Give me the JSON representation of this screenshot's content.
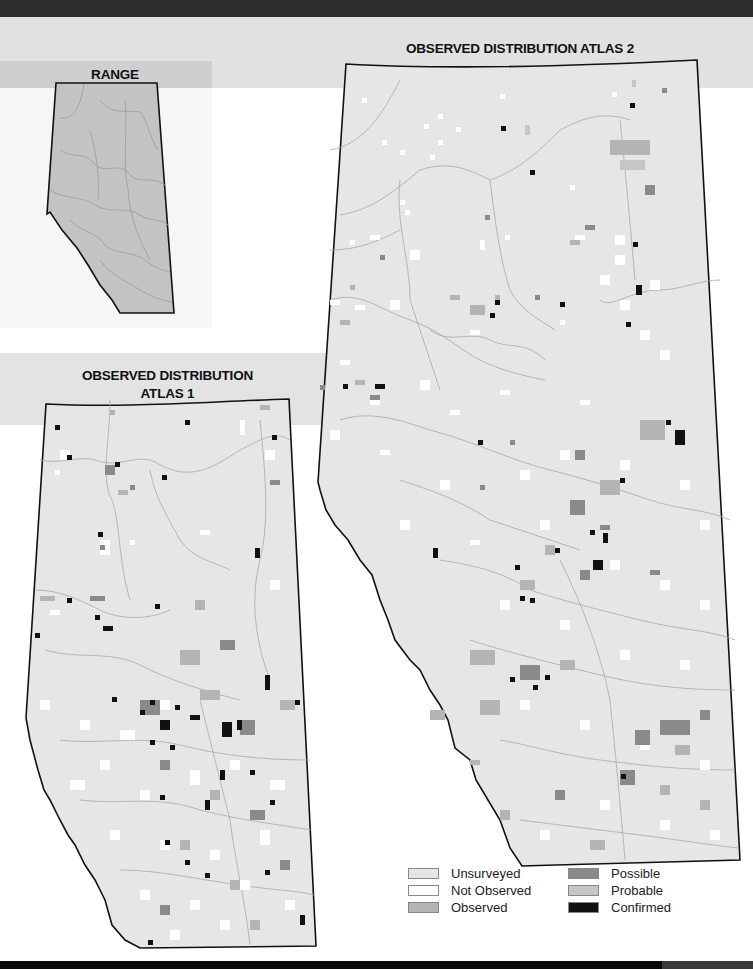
{
  "titles": {
    "range": "RANGE",
    "atlas2": "OBSERVED DISTRIBUTION ATLAS 2",
    "atlas1_line1": "OBSERVED DISTRIBUTION",
    "atlas1_line2": "ATLAS 1"
  },
  "legend": {
    "items": [
      {
        "label": "Unsurveyed",
        "color": "#e6e6e6"
      },
      {
        "label": "Not Observed",
        "color": "#ffffff"
      },
      {
        "label": "Observed",
        "color": "#b4b4b4"
      },
      {
        "label": "Possible",
        "color": "#8a8a8a"
      },
      {
        "label": "Probable",
        "color": "#c6c6c6"
      },
      {
        "label": "Confirmed",
        "color": "#111111"
      }
    ]
  },
  "colors": {
    "range_fill": "#c3c3c3",
    "map_base": "#e6e6e6",
    "border": "#111111",
    "river": "#9c9c9c"
  }
}
